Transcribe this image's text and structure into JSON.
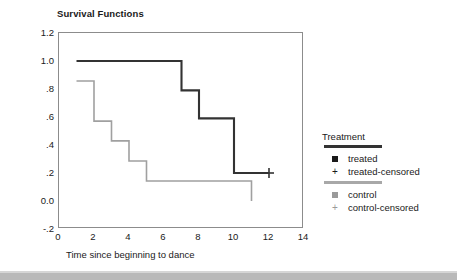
{
  "chart_data": {
    "type": "line",
    "title": "Survival Functions",
    "xlabel": "Time since beginning to dance",
    "ylabel": "Cum Survival",
    "xlim": [
      0,
      14
    ],
    "ylim": [
      -0.2,
      1.2
    ],
    "xticks": [
      "0",
      "2",
      "4",
      "6",
      "8",
      "10",
      "12",
      "14"
    ],
    "xtick_values": [
      0,
      2,
      4,
      6,
      8,
      10,
      12,
      14
    ],
    "yticks": [
      "1.2",
      "1.0",
      ".8",
      ".6",
      ".4",
      ".2",
      "0.0",
      "-.2"
    ],
    "ytick_values": [
      1.2,
      1.0,
      0.8,
      0.6,
      0.4,
      0.2,
      0.0,
      -0.2
    ],
    "grid": false,
    "step_type": "post",
    "legend_position": "right",
    "legend_title": "Treatment",
    "series": [
      {
        "name": "treated",
        "color": "#333333",
        "censored_label": "treated-censored",
        "x": [
          1,
          7,
          7,
          8,
          8,
          10,
          10,
          12
        ],
        "y": [
          1.0,
          1.0,
          0.79,
          0.79,
          0.59,
          0.59,
          0.2,
          0.2
        ],
        "censored_points": [
          {
            "x": 12,
            "y": 0.2
          }
        ]
      },
      {
        "name": "control",
        "color": "#a0a0a0",
        "censored_label": "control-censored",
        "x": [
          1,
          2,
          2,
          3,
          3,
          4,
          4,
          5,
          5,
          11,
          11
        ],
        "y": [
          0.857,
          0.857,
          0.571,
          0.571,
          0.429,
          0.429,
          0.286,
          0.286,
          0.143,
          0.143,
          0.0
        ],
        "censored_points": []
      }
    ]
  },
  "legend": {
    "title": "Treatment",
    "groups": [
      {
        "rule_color": "#333333",
        "rows": [
          {
            "key": "square",
            "key_color": "#1a1a1a",
            "label": "treated"
          },
          {
            "key": "plus",
            "key_color": "#1a1a1a",
            "label": "treated-censored"
          }
        ]
      },
      {
        "rule_color": "#a8a8a8",
        "rows": [
          {
            "key": "square",
            "key_color": "#9a9a9a",
            "label": "control"
          },
          {
            "key": "plus",
            "key_color": "#9a9a9a",
            "label": "control-censored"
          }
        ]
      }
    ]
  },
  "colors": {
    "treated": "#333333",
    "control": "#a0a0a0",
    "frame": "#8c8c8c",
    "text": "#1a1a1a"
  }
}
